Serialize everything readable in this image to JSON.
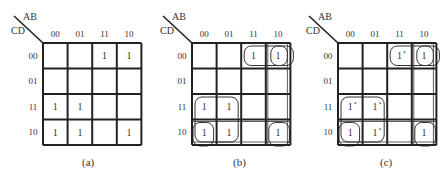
{
  "figure": {
    "row_axis_label": "CD",
    "col_axis_label": "AB",
    "col_headers": [
      "00",
      "01",
      "11",
      "10"
    ],
    "row_headers": [
      "00",
      "01",
      "11",
      "10"
    ],
    "maps": [
      {
        "id": "a",
        "caption": "(a)",
        "cells": [
          [
            "",
            "",
            "1",
            "1"
          ],
          [
            "",
            "",
            "",
            ""
          ],
          [
            "1",
            "1",
            "",
            ""
          ],
          [
            "1",
            "1",
            "",
            "1"
          ]
        ],
        "starred": [],
        "groups": []
      },
      {
        "id": "b",
        "caption": "(b)",
        "cells": [
          [
            "",
            "",
            "1",
            "1"
          ],
          [
            "",
            "",
            "",
            ""
          ],
          [
            "1",
            "1",
            "",
            ""
          ],
          [
            "1",
            "1",
            "",
            "1"
          ]
        ],
        "starred": [],
        "groups": [
          {
            "desc": "AB=11,10 CD=00 pair",
            "r0": 0,
            "c0": 2,
            "r1": 0,
            "c1": 3
          },
          {
            "desc": "AB=10 CD=00 wrap to right edge",
            "r0": 0,
            "c0": 3,
            "r1": 0,
            "c1": 3,
            "wrap": "right"
          },
          {
            "desc": "AB=00,01 CD=11,10 quad",
            "r0": 2,
            "c0": 0,
            "r1": 3,
            "c1": 1
          },
          {
            "desc": "AB=00 CD=10 corner wrap",
            "r0": 3,
            "c0": 0,
            "r1": 3,
            "c1": 0,
            "wrap": "left-bottom"
          },
          {
            "desc": "AB=10 CD=10 corner wrap",
            "r0": 3,
            "c0": 3,
            "r1": 3,
            "c1": 3,
            "wrap": "right-bottom"
          }
        ]
      },
      {
        "id": "c",
        "caption": "(c)",
        "cells": [
          [
            "",
            "",
            "1",
            "1"
          ],
          [
            "",
            "",
            "",
            ""
          ],
          [
            "1",
            "1",
            "",
            ""
          ],
          [
            "1",
            "1",
            "",
            "1"
          ]
        ],
        "starred": [
          [
            0,
            2
          ],
          [
            2,
            0
          ],
          [
            2,
            1
          ],
          [
            3,
            1
          ]
        ],
        "groups": [
          {
            "desc": "AB=11,10 CD=00 pair",
            "r0": 0,
            "c0": 2,
            "r1": 0,
            "c1": 3
          },
          {
            "desc": "AB=10 CD=00 wrap to right edge",
            "r0": 0,
            "c0": 3,
            "r1": 0,
            "c1": 3,
            "wrap": "right"
          },
          {
            "desc": "AB=00,01 CD=11,10 quad",
            "r0": 2,
            "c0": 0,
            "r1": 3,
            "c1": 1
          },
          {
            "desc": "AB=00 CD=10 corner wrap",
            "r0": 3,
            "c0": 0,
            "r1": 3,
            "c1": 0,
            "wrap": "left-bottom"
          },
          {
            "desc": "AB=10 CD=10 corner wrap",
            "r0": 3,
            "c0": 3,
            "r1": 3,
            "c1": 3,
            "wrap": "right-bottom"
          }
        ]
      }
    ],
    "star_mark": "*"
  }
}
